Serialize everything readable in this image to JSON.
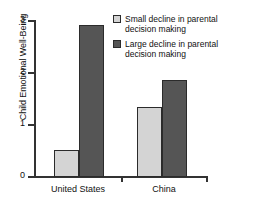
{
  "chart_data": {
    "type": "bar",
    "title": "",
    "xlabel": "",
    "ylabel": "Child Emotional Well-Being",
    "categories": [
      "United States",
      "China"
    ],
    "series": [
      {
        "name": "Small decline in parental decision making",
        "color": "#d4d4d4",
        "values": [
          0.5,
          1.33
        ]
      },
      {
        "name": "Large decline in parental decision making",
        "color": "#555555",
        "values": [
          2.9,
          1.85
        ]
      }
    ],
    "ylim": [
      0,
      3
    ],
    "yticks": [
      "0",
      "1",
      "2",
      "3"
    ],
    "ytick_values": [
      0,
      1,
      2,
      3
    ],
    "grid": false,
    "legend_position": "top-right"
  },
  "legend": {
    "entries": [
      {
        "label": "Small decline in parental decision making",
        "swatch": "small-swatch"
      },
      {
        "label": "Large decline in parental decision making",
        "swatch": "large-swatch"
      }
    ]
  },
  "axes": {
    "y_title": "Child Emotional Well-Being",
    "y_tick_labels": [
      "3",
      "2",
      "1",
      "0"
    ],
    "x_tick_labels": [
      "United States",
      "China"
    ]
  }
}
